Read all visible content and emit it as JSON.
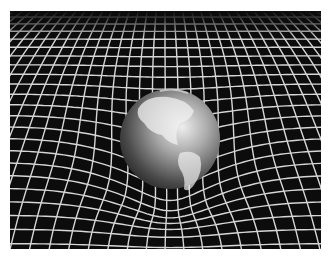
{
  "image": {
    "subject": "Earth resting on a warped spacetime grid",
    "alt": "Illustration of Earth deforming a white grid representing spacetime curvature",
    "colors": {
      "background": "#0c0c0c",
      "grid": "#d8d8d8",
      "globe_light": "#e6e6e6",
      "globe_dark": "#2a2a2a",
      "page": "#ffffff"
    }
  }
}
